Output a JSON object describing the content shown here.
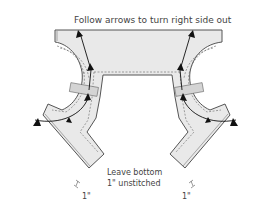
{
  "diagram": {
    "title_instruction": "Follow arrows to turn right side out",
    "bottom_note_line1": "Leave bottom",
    "bottom_note_line2": "1\" unstitched",
    "left_measure": "1\"",
    "right_measure": "1\"",
    "colors": {
      "fabric": "#e9e9e9",
      "outline": "#555555",
      "arrow": "#111111",
      "text": "#444444"
    }
  }
}
